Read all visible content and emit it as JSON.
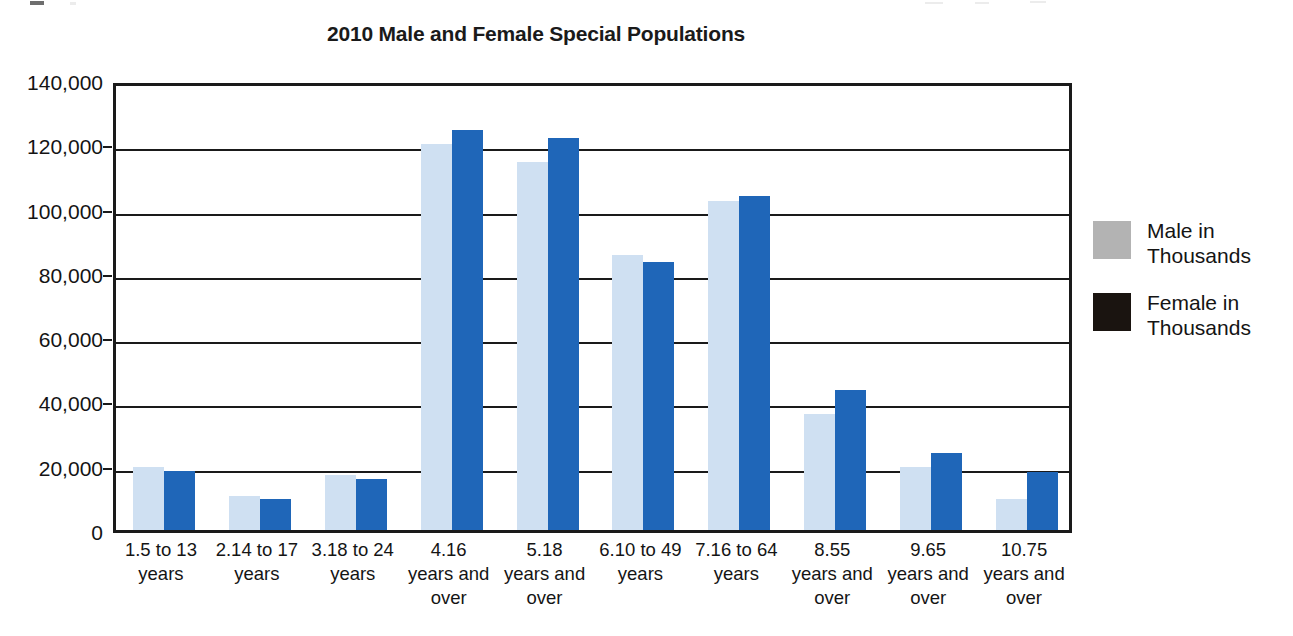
{
  "chart_data": {
    "type": "bar",
    "title": "2010 Male and Female Special Populations",
    "xlabel": "",
    "ylabel": "",
    "ylim": [
      0,
      140000
    ],
    "grid": true,
    "legend_position": "right",
    "y_ticks": [
      "0",
      "20,000",
      "40,000",
      "60,000",
      "80,000",
      "100,000",
      "120,000",
      "140,000"
    ],
    "y_tick_values": [
      0,
      20000,
      40000,
      60000,
      80000,
      100000,
      120000,
      140000
    ],
    "categories": [
      "1.5 to 13 years",
      "2.14 to 17 years",
      "3.18 to 24 years",
      "4.16 years and over",
      "5.18 years and over",
      "6.10 to 49 years",
      "7.16 to 64 years",
      "8.55 years and over",
      "9.65 years and over",
      "10.75 years and over"
    ],
    "category_lines": [
      [
        "1.5 to 13",
        "years"
      ],
      [
        "2.14 to 17",
        "years"
      ],
      [
        "3.18 to 24",
        "years"
      ],
      [
        "4.16",
        "years and",
        "over"
      ],
      [
        "5.18",
        "years and",
        "over"
      ],
      [
        "6.10 to 49",
        "years"
      ],
      [
        "7.16 to 64",
        "years"
      ],
      [
        "8.55",
        "years and",
        "over"
      ],
      [
        "9.65",
        "years and",
        "over"
      ],
      [
        "10.75",
        "years and",
        "over"
      ]
    ],
    "series": [
      {
        "name": "Male in Thousands",
        "color": "#cfe0f2",
        "legend_swatch_color": "#b3b3b3",
        "values": [
          19500,
          10500,
          17000,
          120000,
          114500,
          85500,
          102500,
          36000,
          19500,
          9500
        ]
      },
      {
        "name": "Female in Thousands",
        "color": "#1f66b8",
        "legend_swatch_color": "#1a1410",
        "values": [
          18500,
          9800,
          16000,
          124500,
          122000,
          83500,
          104000,
          43500,
          24000,
          18000
        ]
      }
    ]
  },
  "legend": {
    "items": [
      {
        "label_line1": "Male in",
        "label_line2": "Thousands"
      },
      {
        "label_line1": "Female in",
        "label_line2": "Thousands"
      }
    ]
  },
  "colors": {
    "male_bar": "#cfe0f2",
    "female_bar": "#1f66b8",
    "axis": "#1a1a1a",
    "background": "#ffffff"
  }
}
